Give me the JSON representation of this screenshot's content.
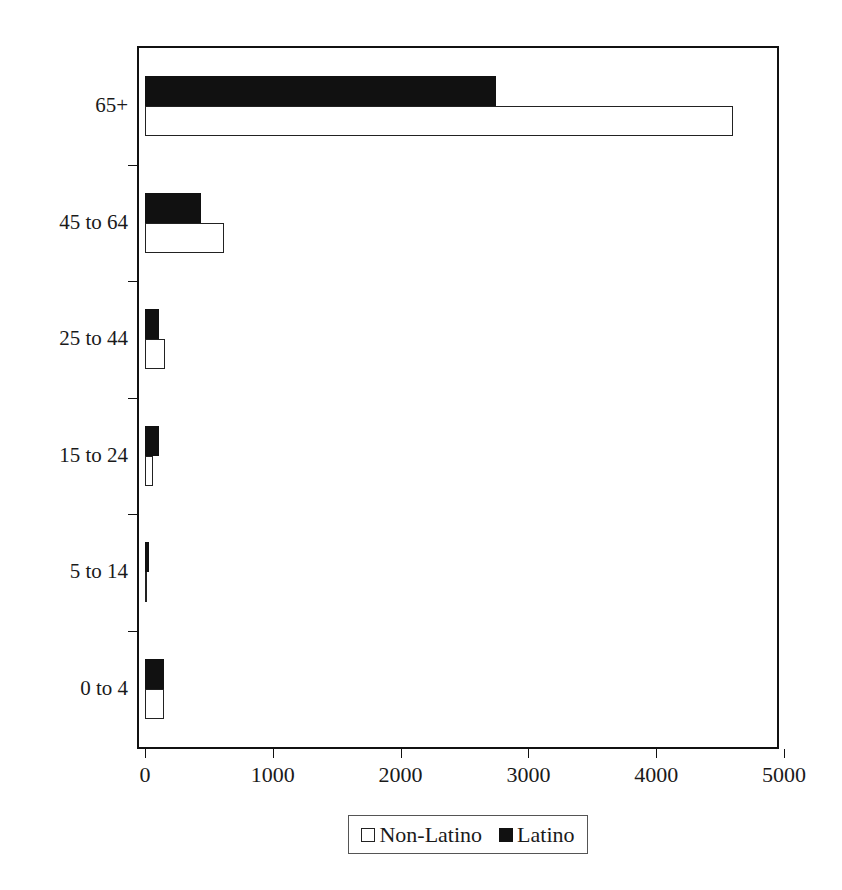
{
  "chart_data": {
    "type": "bar",
    "orientation": "horizontal",
    "title": "",
    "xlabel": "",
    "ylabel": "",
    "categories": [
      "0 to 4",
      "5 to 14",
      "15 to 24",
      "25 to 44",
      "45 to 64",
      "65+"
    ],
    "series": [
      {
        "name": "Non-Latino",
        "color": "#ffffff",
        "values": [
          150,
          15,
          60,
          160,
          620,
          4600
        ]
      },
      {
        "name": "Latino",
        "color": "#111111",
        "values": [
          150,
          30,
          110,
          110,
          440,
          2750
        ]
      }
    ],
    "xlim": [
      0,
      5000
    ],
    "xticks": [
      0,
      1000,
      2000,
      3000,
      4000,
      5000
    ],
    "xtick_labels": [
      "0",
      "1000",
      "2000",
      "3000",
      "4000",
      "5000"
    ],
    "grid": false,
    "legend": {
      "position": "bottom",
      "entries": [
        {
          "label": "Non-Latino",
          "swatch": "open-square"
        },
        {
          "label": "Latino",
          "swatch": "filled-square"
        }
      ]
    }
  }
}
